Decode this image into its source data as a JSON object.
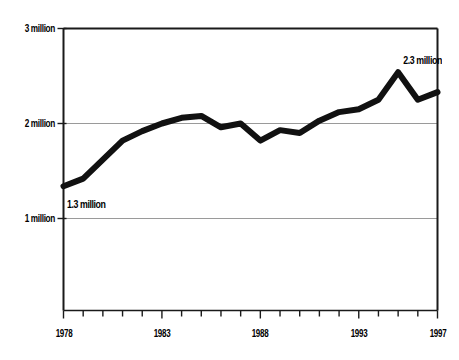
{
  "chart_data": {
    "type": "line",
    "title": "",
    "subtitle": "",
    "xlabel": "",
    "ylabel": "",
    "x": [
      1978,
      1979,
      1980,
      1981,
      1982,
      1983,
      1984,
      1985,
      1986,
      1987,
      1988,
      1989,
      1990,
      1991,
      1992,
      1993,
      1994,
      1995,
      1996,
      1997
    ],
    "values": [
      1.34,
      1.42,
      1.62,
      1.82,
      1.92,
      2.0,
      2.06,
      2.08,
      1.96,
      2.0,
      1.82,
      1.93,
      1.9,
      2.03,
      2.12,
      2.15,
      2.25,
      2.54,
      2.25,
      2.33
    ],
    "series": [
      {
        "name": "series-1",
        "values": [
          1.34,
          1.42,
          1.62,
          1.82,
          1.92,
          2.0,
          2.06,
          2.08,
          1.96,
          2.0,
          1.82,
          1.93,
          1.9,
          2.03,
          2.12,
          2.15,
          2.25,
          2.54,
          2.25,
          2.33
        ]
      }
    ],
    "xlim": [
      1978,
      1997
    ],
    "ylim": [
      0,
      3
    ],
    "y_gridline_values": [
      1,
      2,
      3
    ],
    "grid": true,
    "legend": false,
    "legend_position": "none",
    "line_color": "#111111",
    "line_width_px": 6,
    "grid_color": "#9a9a9a",
    "frame_color": "#1a1a1a",
    "background": "#ffffff"
  },
  "axes": {
    "y_ticks": [
      {
        "value": 3,
        "label": "3 million"
      },
      {
        "value": 2,
        "label": "2 million"
      },
      {
        "value": 1,
        "label": "1 million"
      }
    ],
    "x_ticks": [
      {
        "value": 1978,
        "label": "1978",
        "labeled": true
      },
      {
        "value": 1979,
        "label": "",
        "labeled": false
      },
      {
        "value": 1980,
        "label": "",
        "labeled": false
      },
      {
        "value": 1981,
        "label": "",
        "labeled": false
      },
      {
        "value": 1982,
        "label": "",
        "labeled": false
      },
      {
        "value": 1983,
        "label": "1983",
        "labeled": true
      },
      {
        "value": 1984,
        "label": "",
        "labeled": false
      },
      {
        "value": 1985,
        "label": "",
        "labeled": false
      },
      {
        "value": 1986,
        "label": "",
        "labeled": false
      },
      {
        "value": 1987,
        "label": "",
        "labeled": false
      },
      {
        "value": 1988,
        "label": "1988",
        "labeled": true
      },
      {
        "value": 1989,
        "label": "",
        "labeled": false
      },
      {
        "value": 1990,
        "label": "",
        "labeled": false
      },
      {
        "value": 1991,
        "label": "",
        "labeled": false
      },
      {
        "value": 1992,
        "label": "",
        "labeled": false
      },
      {
        "value": 1993,
        "label": "1993",
        "labeled": true
      },
      {
        "value": 1994,
        "label": "",
        "labeled": false
      },
      {
        "value": 1995,
        "label": "",
        "labeled": false
      },
      {
        "value": 1996,
        "label": "",
        "labeled": false
      },
      {
        "value": 1997,
        "label": "1997",
        "labeled": true
      }
    ]
  },
  "annotations": [
    {
      "id": "start",
      "text": "1.3 million",
      "at_x": 1978,
      "at_y": 1.34
    },
    {
      "id": "end",
      "text": "2.3 million",
      "at_x": 1997,
      "at_y": 2.33
    }
  ]
}
